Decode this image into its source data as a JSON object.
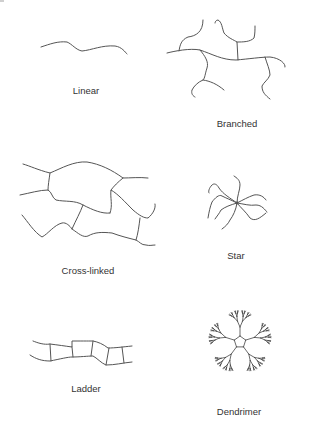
{
  "diagram": {
    "line_color": "#555555",
    "label_color": "#333333",
    "background": "#ffffff",
    "panels": [
      {
        "id": "linear",
        "label": "Linear"
      },
      {
        "id": "branched",
        "label": "Branched"
      },
      {
        "id": "cross-linked",
        "label": "Cross-linked"
      },
      {
        "id": "star",
        "label": "Star"
      },
      {
        "id": "ladder",
        "label": "Ladder"
      },
      {
        "id": "dendrimer",
        "label": "Dendrimer"
      }
    ]
  }
}
